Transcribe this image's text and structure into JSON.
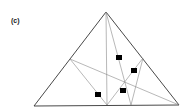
{
  "figure": {
    "label": "(c)",
    "colors": {
      "outline": "#333333",
      "inner_line": "#888888",
      "marker": "#000000"
    },
    "triangle": {
      "apex": [
        106,
        12
      ],
      "left": [
        34,
        106
      ],
      "right": [
        179,
        105
      ]
    },
    "points": {
      "left_side": [
        70,
        59
      ],
      "right_side": [
        143,
        58
      ],
      "base_mid": [
        107,
        105
      ],
      "base_right_foot": [
        131,
        105
      ]
    },
    "markers": [
      {
        "x": 119,
        "y": 57
      },
      {
        "x": 134,
        "y": 70
      },
      {
        "x": 123,
        "y": 90
      },
      {
        "x": 98,
        "y": 94
      }
    ]
  }
}
